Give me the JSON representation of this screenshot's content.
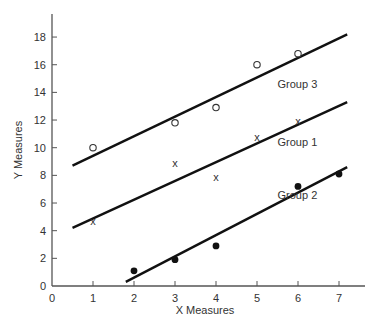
{
  "chart_data": {
    "type": "scatter",
    "title": "",
    "xlabel": "X Measures",
    "ylabel": "Y Measures",
    "xlim": [
      0,
      7.5
    ],
    "ylim": [
      0,
      19
    ],
    "x_ticks": [
      0,
      1,
      2,
      3,
      4,
      5,
      6,
      7
    ],
    "y_ticks": [
      0,
      2,
      4,
      6,
      8,
      10,
      12,
      14,
      16,
      18
    ],
    "grid": false,
    "legend": "none (inline line labels)",
    "series": [
      {
        "name": "Group 3",
        "marker": "open-circle",
        "points": [
          [
            1,
            10.0
          ],
          [
            3,
            11.8
          ],
          [
            4,
            12.9
          ],
          [
            5,
            16.0
          ],
          [
            6,
            16.8
          ]
        ],
        "fit_line": [
          [
            0.5,
            8.7
          ],
          [
            7.2,
            18.2
          ]
        ],
        "label_pos": [
          5.5,
          14.3
        ]
      },
      {
        "name": "Group 1",
        "marker": "x",
        "points": [
          [
            1,
            4.7
          ],
          [
            3,
            8.9
          ],
          [
            4,
            7.9
          ],
          [
            5,
            10.8
          ],
          [
            6,
            11.9
          ]
        ],
        "fit_line": [
          [
            0.5,
            4.2
          ],
          [
            7.2,
            13.3
          ]
        ],
        "label_pos": [
          5.5,
          10.1
        ]
      },
      {
        "name": "Group 2",
        "marker": "filled-circle",
        "points": [
          [
            2,
            1.1
          ],
          [
            3,
            1.9
          ],
          [
            4,
            2.9
          ],
          [
            6,
            7.2
          ],
          [
            7,
            8.1
          ]
        ],
        "fit_line": [
          [
            1.8,
            0.3
          ],
          [
            7.2,
            8.6
          ]
        ],
        "label_pos": [
          5.5,
          6.3
        ]
      }
    ]
  },
  "layout": {
    "plot_left": 52,
    "plot_bottom": 286,
    "px_per_x": 41,
    "px_per_y": 13.83,
    "x_axis_end": 365,
    "y_axis_top": 14,
    "line_color": "#111111",
    "text_color": "#333333"
  }
}
